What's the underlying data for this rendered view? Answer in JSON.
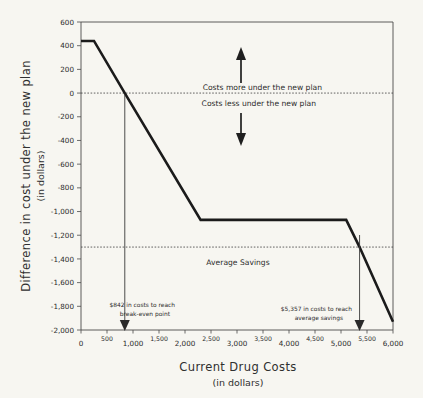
{
  "chart_data": {
    "type": "line",
    "title": "",
    "xlabel": "Current Drug Costs",
    "xlabel_sub": "(in dollars)",
    "ylabel": "Difference in cost under the new plan",
    "ylabel_sub": "(in dollars)",
    "xlim": [
      0,
      6000
    ],
    "ylim": [
      -2000,
      600
    ],
    "grid": false,
    "legend": "none",
    "x_ticks": [
      0,
      500,
      1000,
      1500,
      2000,
      2500,
      3000,
      3500,
      4000,
      4500,
      5000,
      5500,
      6000
    ],
    "x_tick_labels": [
      "0",
      "500",
      "1,000",
      "1,500",
      "2,000",
      "2,500",
      "3,000",
      "3,500",
      "4,000",
      "4,500",
      "5,000",
      "5,500",
      "6,000"
    ],
    "y_ticks": [
      600,
      400,
      200,
      0,
      -200,
      -400,
      -600,
      -800,
      -1000,
      -1200,
      -1400,
      -1600,
      -1800,
      -2000
    ],
    "y_tick_labels": [
      "600",
      "400",
      "200",
      "0",
      "-200",
      "-400",
      "-600",
      "-800",
      "-1,000",
      "-1,200",
      "-1,400",
      "-1,600",
      "-1,800",
      "-2,000"
    ],
    "series": [
      {
        "name": "Difference in cost under the new plan",
        "color": "#1b1b1b",
        "points": [
          [
            0,
            440
          ],
          [
            250,
            440
          ],
          [
            842,
            0
          ],
          [
            2300,
            -1070
          ],
          [
            5100,
            -1070
          ],
          [
            5357,
            -1300
          ],
          [
            6000,
            -1930
          ]
        ]
      }
    ],
    "reference_lines": [
      {
        "name": "break-even",
        "orientation": "horizontal",
        "value": 0,
        "style": "dotted"
      },
      {
        "name": "average-savings",
        "orientation": "horizontal",
        "value": -1300,
        "style": "dotted",
        "label": "Average Savings"
      }
    ],
    "annotations": [
      {
        "name": "costs-more",
        "text": "Costs more under the new plan",
        "x": 3200,
        "y": 150
      },
      {
        "name": "costs-less",
        "text": "Costs less under the new plan",
        "x": 3200,
        "y": -150
      },
      {
        "name": "break-even-callout",
        "line1": "$842 in costs to reach",
        "line2": "break-even point",
        "pointer_x": 842,
        "value": 842
      },
      {
        "name": "average-savings-callout",
        "line1": "$5,357 in costs to reach",
        "line2": "average savings",
        "pointer_x": 5357,
        "value": 5357
      }
    ],
    "colors": {
      "background": "#f7f6f1",
      "series": "#1b1b1b",
      "axis": "#4a4a4a",
      "text": "#2a2a2a"
    }
  }
}
